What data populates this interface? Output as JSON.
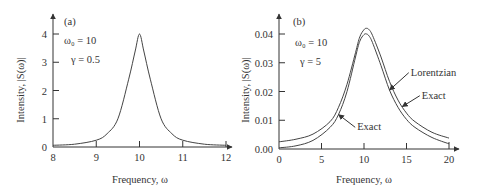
{
  "chart_data": [
    {
      "type": "line",
      "panel_label": "(a)",
      "title": "",
      "xlabel": "Frequency, ω",
      "ylabel": "Intensity, |S(ω)|",
      "xlim": [
        8,
        12
      ],
      "ylim": [
        0,
        4
      ],
      "xticks": [
        "8",
        "9",
        "10",
        "11",
        "12"
      ],
      "yticks": [
        "0",
        "1",
        "2",
        "3",
        "4"
      ],
      "xtick_values": [
        8,
        9,
        10,
        11,
        12
      ],
      "ytick_values": [
        0,
        1,
        2,
        3,
        4
      ],
      "grid": false,
      "params": {
        "omega0_label": "ω₀ = 10",
        "gamma_label": "γ = 0.5",
        "omega0": 10,
        "gamma": 0.5
      },
      "series": [
        {
          "name": "Intensity",
          "x": [
            8.0,
            8.5,
            9.0,
            9.25,
            9.5,
            9.75,
            9.9,
            10.0,
            10.1,
            10.25,
            10.5,
            10.75,
            11.0,
            11.5,
            12.0
          ],
          "y": [
            0.06,
            0.1,
            0.24,
            0.47,
            1.0,
            2.4,
            3.4,
            4.0,
            3.4,
            2.4,
            1.0,
            0.47,
            0.24,
            0.1,
            0.06
          ]
        }
      ]
    },
    {
      "type": "line",
      "panel_label": "(b)",
      "title": "",
      "xlabel": "Frequency, ω",
      "ylabel": "Intensity, |S(ω)|",
      "xlim": [
        0,
        20
      ],
      "ylim": [
        0,
        0.04
      ],
      "xticks": [
        "0",
        "5",
        "10",
        "15",
        "20"
      ],
      "yticks": [
        "0.00",
        "0.01",
        "0.02",
        "0.03",
        "0.04"
      ],
      "xtick_values": [
        0,
        5,
        10,
        15,
        20
      ],
      "ytick_values": [
        0,
        0.01,
        0.02,
        0.03,
        0.04
      ],
      "grid": false,
      "params": {
        "omega0_label": "ω₀ = 10",
        "gamma_label": "γ = 5",
        "omega0": 10,
        "gamma": 5
      },
      "annotations": [
        {
          "text": "Lorentzian",
          "target_x": 13.0,
          "target_series": 1,
          "label_x": 15.5,
          "label_y": 0.0255
        },
        {
          "text": "Exact",
          "target_x": 14.5,
          "target_series": 0,
          "label_x": 16.8,
          "label_y": 0.0175
        },
        {
          "text": "Exact",
          "target_x": 7.0,
          "target_series": 1,
          "label_x": 9.2,
          "label_y": 0.0065
        }
      ],
      "series": [
        {
          "name": "Outer curve",
          "x": [
            0,
            2,
            4,
            6,
            7,
            8,
            9,
            9.5,
            10,
            10.3,
            10.6,
            11,
            12,
            13,
            14,
            15,
            16,
            18,
            20
          ],
          "y": [
            0.0025,
            0.0034,
            0.0052,
            0.0095,
            0.0145,
            0.0225,
            0.0335,
            0.039,
            0.0415,
            0.042,
            0.0415,
            0.0395,
            0.032,
            0.0235,
            0.017,
            0.0125,
            0.0095,
            0.0058,
            0.0038
          ]
        },
        {
          "name": "Inner curve",
          "x": [
            0,
            2,
            4,
            6,
            7,
            8,
            9,
            9.5,
            10,
            10.3,
            10.6,
            11,
            12,
            13,
            14,
            15,
            16,
            18,
            20
          ],
          "y": [
            0.0004,
            0.0011,
            0.003,
            0.0075,
            0.012,
            0.02,
            0.032,
            0.0375,
            0.0398,
            0.04,
            0.0393,
            0.037,
            0.029,
            0.0205,
            0.0145,
            0.0103,
            0.0075,
            0.004,
            0.0018
          ]
        }
      ]
    }
  ]
}
